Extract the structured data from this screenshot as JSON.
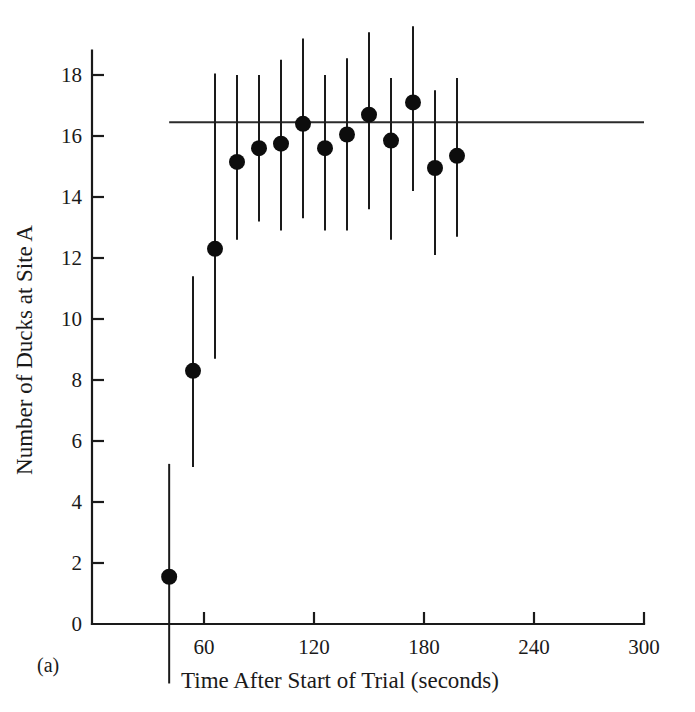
{
  "figure": {
    "panel_label": "(a)",
    "background_color": "#ffffff",
    "ink_color": "#1a1a1a"
  },
  "chart_data": {
    "type": "scatter",
    "title": "",
    "subtitle": "",
    "xlabel": "Time After Start of Trial (seconds)",
    "ylabel": "Number of Ducks at Site A",
    "xlim": [
      30,
      300
    ],
    "ylim": [
      0,
      18.8
    ],
    "xticks": [
      60,
      120,
      180,
      240,
      300
    ],
    "xtick_labels": [
      "60",
      "120",
      "180",
      "240",
      "300"
    ],
    "yticks": [
      0,
      2,
      4,
      6,
      8,
      10,
      12,
      14,
      16,
      18
    ],
    "ytick_labels": [
      "0",
      "2",
      "4",
      "6",
      "8",
      "10",
      "12",
      "14",
      "16",
      "18"
    ],
    "grid": false,
    "legend": "none",
    "marker_style": "filled-circle",
    "error_bar_style": "vertical-line-no-caps",
    "reference_line": {
      "label": "expected equilibrium",
      "orientation": "horizontal",
      "y": 16.45,
      "x_start": 41,
      "x_end": 300
    },
    "x": [
      41,
      54,
      66,
      78,
      90,
      102,
      114,
      126,
      138,
      150,
      162,
      174,
      186,
      198
    ],
    "values": [
      1.55,
      8.3,
      12.3,
      15.15,
      15.6,
      15.75,
      16.4,
      15.6,
      16.05,
      16.7,
      15.85,
      17.1,
      14.95,
      15.35
    ],
    "error_upper": [
      5.25,
      11.4,
      18.05,
      18.0,
      18.0,
      18.5,
      19.2,
      18.0,
      18.55,
      19.4,
      17.9,
      19.6,
      17.5,
      17.9
    ],
    "error_lower": [
      -1.95,
      5.15,
      8.7,
      12.6,
      13.2,
      12.9,
      13.3,
      12.9,
      12.9,
      13.6,
      12.6,
      14.2,
      12.1,
      12.7
    ],
    "points": [
      {
        "x": 41,
        "y": 1.55,
        "hi": 5.25,
        "lo": -1.95
      },
      {
        "x": 54,
        "y": 8.3,
        "hi": 11.4,
        "lo": 5.15
      },
      {
        "x": 66,
        "y": 12.3,
        "hi": 18.05,
        "lo": 8.7
      },
      {
        "x": 78,
        "y": 15.15,
        "hi": 18.0,
        "lo": 12.6
      },
      {
        "x": 90,
        "y": 15.6,
        "hi": 18.0,
        "lo": 13.2
      },
      {
        "x": 102,
        "y": 15.75,
        "hi": 18.5,
        "lo": 12.9
      },
      {
        "x": 114,
        "y": 16.4,
        "hi": 19.2,
        "lo": 13.3
      },
      {
        "x": 126,
        "y": 15.6,
        "hi": 18.0,
        "lo": 12.9
      },
      {
        "x": 138,
        "y": 16.05,
        "hi": 18.55,
        "lo": 12.9
      },
      {
        "x": 150,
        "y": 16.7,
        "hi": 19.4,
        "lo": 13.6
      },
      {
        "x": 162,
        "y": 15.85,
        "hi": 17.9,
        "lo": 12.6
      },
      {
        "x": 174,
        "y": 17.1,
        "hi": 19.6,
        "lo": 14.2
      },
      {
        "x": 186,
        "y": 14.95,
        "hi": 17.5,
        "lo": 12.1
      },
      {
        "x": 198,
        "y": 15.35,
        "hi": 17.9,
        "lo": 12.7
      }
    ]
  }
}
